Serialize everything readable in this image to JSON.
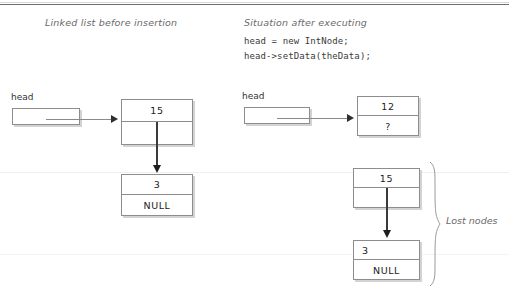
{
  "figure": {
    "left_caption": "Linked list before insertion",
    "right_caption": "Situation after executing",
    "code": [
      "head = new IntNode;",
      "head->setData(theData);"
    ]
  },
  "left_diagram": {
    "head_label": "head",
    "node1": {
      "data": "15",
      "next": ""
    },
    "node2": {
      "data": "3",
      "next": "NULL"
    }
  },
  "right_diagram": {
    "head_label": "head",
    "new_node": {
      "data": "12",
      "next": "?"
    },
    "lost_node1": {
      "data": "15",
      "next": ""
    },
    "lost_node2": {
      "data": "3",
      "next": "NULL"
    },
    "lost_label": "Lost nodes"
  },
  "colors": {
    "box_border": "#8d8d8d",
    "box_shadow": "#d3d3d3",
    "arrow": "#2f2f2f",
    "caption_text": "#6a6a6a",
    "rule": "#6e6e6e"
  }
}
